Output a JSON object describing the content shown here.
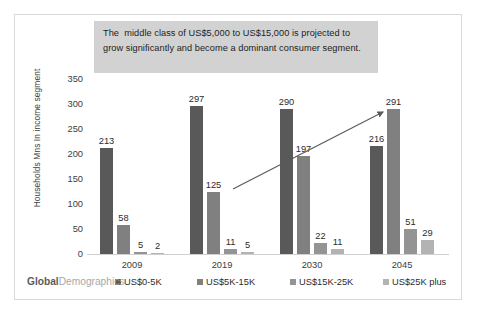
{
  "callout": {
    "text": "The  middle class of US$5,000 to US$15,000 is projected to grow significantly and become a dominant consumer segment."
  },
  "brand": {
    "primary": "Global",
    "secondary": "Demographics"
  },
  "axis": {
    "y_title": "Households Mns In income segment"
  },
  "chart_data": {
    "type": "bar",
    "title": "",
    "subtitle": "",
    "xlabel": "",
    "ylabel": "Households Mns In income segment",
    "ylim": [
      0,
      350
    ],
    "yticks": [
      0,
      50,
      100,
      150,
      200,
      250,
      300,
      350
    ],
    "ytick_labels": [
      "0",
      "50",
      "100",
      "150",
      "200",
      "250",
      "300",
      "350"
    ],
    "grid": false,
    "legend_position": "bottom",
    "categories": [
      "2009",
      "2019",
      "2030",
      "2045"
    ],
    "series": [
      {
        "name": "US$0-5K",
        "color": "#595959",
        "values": [
          213,
          297,
          290,
          216
        ]
      },
      {
        "name": "US$5K-15K",
        "color": "#808080",
        "values": [
          58,
          125,
          197,
          291
        ]
      },
      {
        "name": "US$15K-25K",
        "color": "#949494",
        "values": [
          5,
          11,
          22,
          51
        ]
      },
      {
        "name": "US$25K plus",
        "color": "#b3b3b3",
        "values": [
          2,
          5,
          11,
          29
        ]
      }
    ],
    "annotations": [
      {
        "type": "arrow",
        "label": "growth-trend-arrow",
        "from": [
          218,
          174
        ],
        "to": [
          372,
          95
        ],
        "color": "#595959"
      },
      {
        "type": "textbox",
        "label": "callout",
        "text": "The  middle class of US$5,000 to US$15,000 is projected to grow significantly and become a dominant consumer segment."
      }
    ]
  }
}
